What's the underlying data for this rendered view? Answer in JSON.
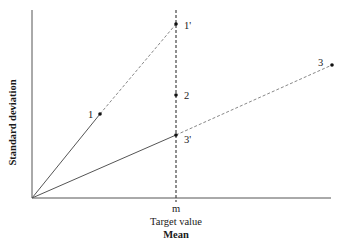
{
  "diagram": {
    "y_axis_title": "Standard deviation",
    "x_axis_title": "Mean",
    "target_label": "Target value",
    "target_tick": "m",
    "points": [
      {
        "id": "p1",
        "label": "1"
      },
      {
        "id": "p1prime",
        "label": "1'"
      },
      {
        "id": "p2",
        "label": "2"
      },
      {
        "id": "p3",
        "label": "3"
      },
      {
        "id": "p3prime",
        "label": "3'"
      }
    ],
    "colors": {
      "axis": "#555555",
      "solid_line": "#555555",
      "dashed_line": "#888888",
      "target_line": "#444444",
      "point": "#111111"
    }
  }
}
